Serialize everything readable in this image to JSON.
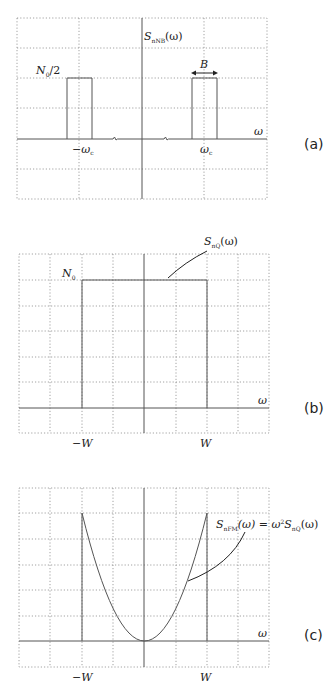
{
  "figure": {
    "panels": [
      {
        "id": "a",
        "tag": "(a)",
        "ylabel": "S",
        "ylabel_sub": "nNB",
        "ylabel_arg": "(ω)",
        "xlabel": "ω",
        "level_label": "N",
        "level_sub": "0",
        "level_suffix": "/2",
        "bandwidth_label": "B",
        "tick_left": "−ω",
        "tick_left_sub": "c",
        "tick_right": "ω",
        "tick_right_sub": "c"
      },
      {
        "id": "b",
        "tag": "(b)",
        "curve_label": "S",
        "curve_label_sub": "nQ",
        "curve_label_arg": "(ω)",
        "xlabel": "ω",
        "level_label": "N",
        "level_sub": "0",
        "tick_left": "−W",
        "tick_right": "W"
      },
      {
        "id": "c",
        "tag": "(c)",
        "curve_label": "S",
        "curve_label_sub": "nFM",
        "curve_label_mid": "(ω) = ω",
        "curve_label_sup": "2",
        "curve_label_s2": "S",
        "curve_label_sub2": "nQ",
        "curve_label_arg": "(ω)",
        "xlabel": "ω",
        "tick_left": "−W",
        "tick_right": "W"
      }
    ]
  }
}
